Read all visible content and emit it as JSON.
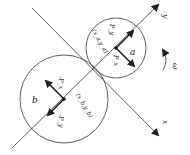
{
  "diagram": {
    "axes": {
      "x_label": "x",
      "y_label": "y"
    },
    "rotation": {
      "symbol": "ω"
    },
    "circle_a": {
      "label": "a",
      "center_label": "(x_a,y_a)",
      "force_1_label": "P_y",
      "force_2_label": "P_x"
    },
    "circle_b": {
      "label": "b",
      "center_label": "(x_b,y_b)",
      "force_1_label": "-P_x",
      "force_2_label": "-P_y"
    },
    "colors": {
      "stroke": "#222222",
      "background": "#ffffff"
    }
  }
}
